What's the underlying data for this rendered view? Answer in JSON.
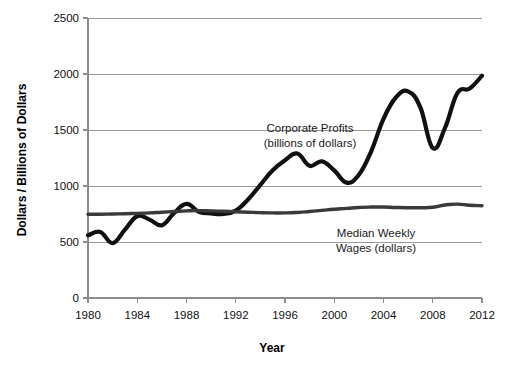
{
  "chart_data": {
    "type": "line",
    "title": "",
    "xlabel": "Year",
    "ylabel": "Dollars / Billions of Dollars",
    "xlim": [
      1980,
      2012
    ],
    "ylim": [
      0,
      2500
    ],
    "grid": true,
    "legend": "annotations-inline",
    "xticks": [
      "1980",
      "1984",
      "1988",
      "1992",
      "1996",
      "2000",
      "2004",
      "2008",
      "2012"
    ],
    "xtick_values": [
      1980,
      1984,
      1988,
      1992,
      1996,
      2000,
      2004,
      2008,
      2012
    ],
    "yticks": [
      "0",
      "500",
      "1000",
      "1500",
      "2000",
      "2500"
    ],
    "ytick_values": [
      0,
      500,
      1000,
      1500,
      2000,
      2500
    ],
    "x": [
      1980,
      1981,
      1982,
      1983,
      1984,
      1985,
      1986,
      1987,
      1988,
      1989,
      1990,
      1991,
      1992,
      1993,
      1994,
      1995,
      1996,
      1997,
      1998,
      1999,
      2000,
      2001,
      2002,
      2003,
      2004,
      2005,
      2006,
      2007,
      2008,
      2009,
      2010,
      2011,
      2012
    ],
    "series": [
      {
        "name": "Corporate Profits",
        "unit": "billions of dollars",
        "color": "#111111",
        "width": 4.2,
        "annotation_line1": "Corporate Profits",
        "annotation_line2": "(billions of dollars)",
        "values": [
          560,
          590,
          490,
          610,
          730,
          700,
          650,
          760,
          840,
          770,
          755,
          750,
          780,
          880,
          1010,
          1140,
          1230,
          1290,
          1180,
          1220,
          1140,
          1030,
          1100,
          1310,
          1600,
          1790,
          1845,
          1700,
          1340,
          1520,
          1830,
          1870,
          1985
        ]
      },
      {
        "name": "Median Weekly Wages",
        "unit": "dollars",
        "color": "#3a3a3a",
        "width": 3.4,
        "annotation_line1": "Median Weekly",
        "annotation_line2": "Wages (dollars)",
        "values": [
          748,
          748,
          750,
          752,
          756,
          760,
          766,
          772,
          778,
          780,
          778,
          774,
          770,
          766,
          762,
          760,
          760,
          764,
          772,
          782,
          792,
          800,
          808,
          812,
          812,
          808,
          806,
          806,
          810,
          830,
          838,
          828,
          824
        ]
      }
    ],
    "annotations": [
      {
        "id": "corporate-profits-label",
        "line1": "Corporate Profits",
        "line2": "(billions of dollars)",
        "x_px": 310,
        "y_px": 132
      },
      {
        "id": "median-weekly-wages-label",
        "line1": "Median Weekly",
        "line2": "Wages (dollars)",
        "x_px": 376,
        "y_px": 237
      }
    ]
  }
}
